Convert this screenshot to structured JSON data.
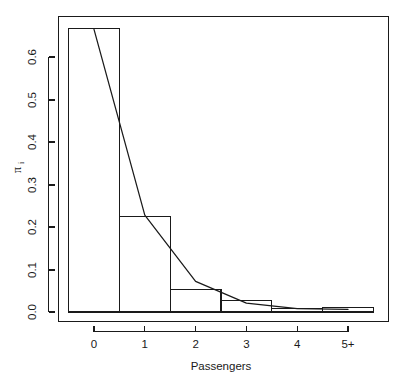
{
  "figure": {
    "background_color": "#ffffff",
    "ink_color": "#1a1a1a"
  },
  "chart_data": {
    "type": "bar",
    "title": "",
    "subtitle": "",
    "xlabel": "Passengers",
    "ylabel": "π",
    "ylabel_subscript": "i",
    "categories": [
      "0",
      "1",
      "2",
      "3",
      "4",
      "5+"
    ],
    "values": [
      0.668,
      0.225,
      0.052,
      0.028,
      0.008,
      0.01
    ],
    "bar_edges": [
      -0.5,
      0.5,
      1.5,
      2.5,
      3.5,
      4.5,
      5.5
    ],
    "xlim": [
      -0.72,
      5.9
    ],
    "ylim": [
      0.0,
      0.716
    ],
    "xticks": [
      0,
      1,
      2,
      3,
      4,
      5
    ],
    "xticklabels": [
      "0",
      "1",
      "2",
      "3",
      "4",
      "5+"
    ],
    "yticks": [
      0.0,
      0.1,
      0.2,
      0.3,
      0.4,
      0.5,
      0.6
    ],
    "yticklabels": [
      "0.0",
      "0.1",
      "0.2",
      "0.3",
      "0.4",
      "0.5",
      "0.6"
    ],
    "grid": false,
    "legend": null,
    "legend_position": "none",
    "series": [
      {
        "name": "Observed proportions",
        "type": "bar",
        "categories": [
          "0",
          "1",
          "2",
          "3",
          "4",
          "5+"
        ],
        "values": [
          0.668,
          0.225,
          0.052,
          0.028,
          0.008,
          0.01
        ],
        "fill": "none",
        "edge_color": "#1a1a1a"
      },
      {
        "name": "Fitted model",
        "type": "line",
        "x": [
          0,
          1,
          2,
          3,
          4,
          5
        ],
        "y": [
          0.665,
          0.228,
          0.072,
          0.021,
          0.008,
          0.006
        ],
        "color": "#1a1a1a"
      }
    ],
    "annotations": []
  }
}
